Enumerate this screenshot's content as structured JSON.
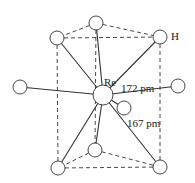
{
  "diagram": {
    "central_atom": {
      "label": "Re",
      "x": 103,
      "y": 95,
      "r": 10
    },
    "ligand_label": "H",
    "bond_labels": {
      "long": "172 pm",
      "short": "167 pm"
    },
    "colors": {
      "line": "#333333",
      "atom_fill": "#ffffff",
      "text": "#222222"
    },
    "atoms": [
      {
        "id": "top-center",
        "x": 96,
        "y": 23,
        "r": 7
      },
      {
        "id": "top-left",
        "x": 57,
        "y": 38,
        "r": 7
      },
      {
        "id": "top-right",
        "x": 160,
        "y": 37,
        "r": 7
      },
      {
        "id": "left",
        "x": 20,
        "y": 87,
        "r": 7
      },
      {
        "id": "right",
        "x": 178,
        "y": 86,
        "r": 7
      },
      {
        "id": "front",
        "x": 124,
        "y": 108,
        "r": 7
      },
      {
        "id": "bottom-center",
        "x": 95,
        "y": 150,
        "r": 7
      },
      {
        "id": "bottom-left",
        "x": 58,
        "y": 168,
        "r": 7
      },
      {
        "id": "bottom-right",
        "x": 160,
        "y": 167,
        "r": 7
      }
    ]
  }
}
